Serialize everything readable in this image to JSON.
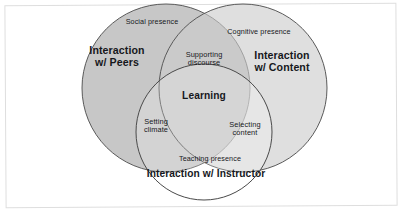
{
  "figure": {
    "kind": "venn-diagram",
    "set_count": 3,
    "frame_color": "#dedede",
    "background_color": "#ffffff",
    "text_color": "#16181c"
  },
  "circles": {
    "peers": {
      "title": "Interaction\nw/ Peers",
      "presence_label": "Social presence",
      "fill_color": "#c4c4c4",
      "stroke_color": "#5a5a5a",
      "cx": 166,
      "cy": 88,
      "r": 84
    },
    "content": {
      "title": "Interaction\nw/ Content",
      "presence_label": "Cognitive presence",
      "fill_color": "#dcdcdc",
      "stroke_color": "#5a5a5a",
      "cx": 243,
      "cy": 88,
      "r": 84
    },
    "instructor": {
      "title": "Interaction w/ Instructor",
      "presence_label": "Teaching presence",
      "fill_color": "#ffffff",
      "stroke_color": "#5a5a5a",
      "cx": 204,
      "cy": 132,
      "r": 68
    }
  },
  "overlaps": {
    "peers_content": "Supporting\ndiscourse",
    "peers_instructor": "Setting\nclimate",
    "content_instructor": "Selecting\ncontent",
    "all_three": "Learning"
  },
  "label_positions": {
    "social_presence": {
      "x": 152,
      "y": 22
    },
    "cognitive_presence": {
      "x": 259,
      "y": 32
    },
    "teaching_presence": {
      "x": 210,
      "y": 159
    },
    "peers_title": {
      "x": 117,
      "y": 57
    },
    "content_title": {
      "x": 282,
      "y": 62
    },
    "instructor_title": {
      "x": 206,
      "y": 174
    },
    "supporting_discourse": {
      "x": 204,
      "y": 59
    },
    "learning": {
      "x": 204,
      "y": 96
    },
    "setting_climate": {
      "x": 156,
      "y": 126
    },
    "selecting_content": {
      "x": 245,
      "y": 129
    }
  }
}
